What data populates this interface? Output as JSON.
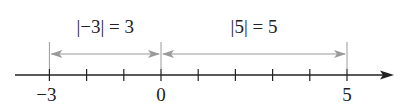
{
  "diagram": {
    "type": "number-line",
    "axis": {
      "min_value": -3,
      "max_value": 5,
      "tick_values": [
        -3,
        -2,
        -1,
        0,
        1,
        2,
        3,
        4,
        5
      ],
      "labeled_ticks": [
        {
          "value": -3,
          "label": "−3"
        },
        {
          "value": 0,
          "label": "0"
        },
        {
          "value": 5,
          "label": "5"
        }
      ],
      "direction_arrow": "right"
    },
    "distances": [
      {
        "from": -3,
        "to": 0,
        "label": "|−3| = 3"
      },
      {
        "from": 0,
        "to": 5,
        "label": "|5| = 5"
      }
    ],
    "colors": {
      "axis": "#222222",
      "distance_arrow": "#9a9a9a",
      "text": "#222222"
    }
  }
}
